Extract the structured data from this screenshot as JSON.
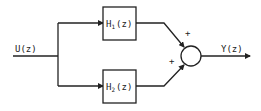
{
  "diagram": {
    "type": "parallel block diagram",
    "input": {
      "label": "U(z)"
    },
    "output": {
      "label": "Y(z)"
    },
    "blocks": [
      {
        "name": "H",
        "subscript": "1",
        "arg": "(z)"
      },
      {
        "name": "H",
        "subscript": "2",
        "arg": "(z)"
      }
    ],
    "summing_junction": {
      "signs": [
        "+",
        "+"
      ]
    },
    "colors": {
      "stroke": "#222222",
      "background": "#ffffff"
    }
  }
}
